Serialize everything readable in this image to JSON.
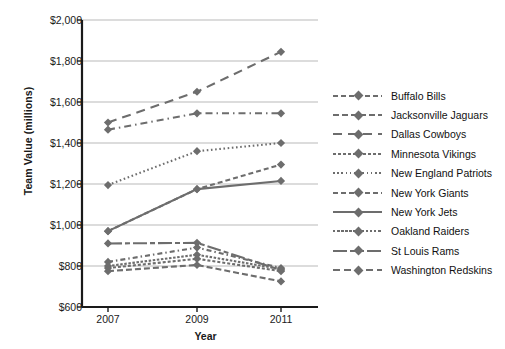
{
  "chart_data": {
    "type": "line",
    "title": "",
    "xlabel": "Year",
    "ylabel": "Team Value (millions)",
    "x": [
      2007,
      2009,
      2011
    ],
    "xtick_labels": [
      "2007",
      "2009",
      "2011"
    ],
    "ytick_labels": [
      "$2,000",
      "$1,800",
      "$1,600",
      "$1,400",
      "$1,200",
      "$1,000",
      "$800",
      "$600"
    ],
    "ylim": [
      600,
      2000
    ],
    "ytick_values": [
      2000,
      1800,
      1600,
      1400,
      1200,
      1000,
      800,
      600
    ],
    "grid": true,
    "legend_position": "right",
    "marker": "diamond",
    "series_color": "#6d6d6d",
    "grid_color": "#b9b9b9",
    "axis_color": "#1a1a1a",
    "series": [
      {
        "name": "Buffalo Bills",
        "dash": "5,3,1.5,3",
        "values": [
          820,
          890,
          790
        ]
      },
      {
        "name": "Jacksonville Jaguars",
        "dash": "6,3",
        "values": [
          775,
          805,
          725
        ]
      },
      {
        "name": "Dallas Cowboys",
        "dash": "9,6",
        "values": [
          1500,
          1650,
          1845
        ]
      },
      {
        "name": "Minnesota Vikings",
        "dash": "3,2",
        "values": [
          790,
          835,
          775
        ]
      },
      {
        "name": "New England Patriots",
        "dash": "1.6,2.6",
        "values": [
          1195,
          1360,
          1400
        ]
      },
      {
        "name": "New York Giants",
        "dash": "5,3",
        "values": [
          970,
          1175,
          1295
        ]
      },
      {
        "name": "New York Jets",
        "dash": "0",
        "values": [
          970,
          1175,
          1215
        ]
      },
      {
        "name": "Oakland Raiders",
        "dash": "2.5,1.6",
        "values": [
          800,
          855,
          785
        ]
      },
      {
        "name": "St Louis Rams",
        "dash": "14,3,5,3",
        "values": [
          910,
          913,
          780
        ]
      },
      {
        "name": "Washington Redskins",
        "dash": "7,4,1.5,4",
        "values": [
          1465,
          1545,
          1545
        ]
      }
    ]
  },
  "legend": {
    "items": [
      {
        "label": "Buffalo Bills"
      },
      {
        "label": "Jacksonville Jaguars"
      },
      {
        "label": "Dallas Cowboys"
      },
      {
        "label": "Minnesota Vikings"
      },
      {
        "label": "New England Patriots"
      },
      {
        "label": "New York Giants"
      },
      {
        "label": "New York Jets"
      },
      {
        "label": "Oakland Raiders"
      },
      {
        "label": "St Louis Rams"
      },
      {
        "label": "Washington Redskins"
      }
    ]
  }
}
